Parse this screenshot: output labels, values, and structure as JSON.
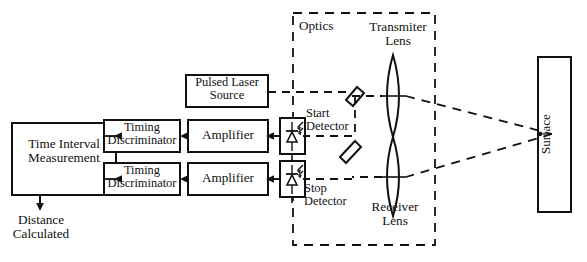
{
  "diagram": {
    "colors": {
      "stroke": "#111111",
      "background": "#ffffff",
      "beam": "#111111"
    },
    "blocks": {
      "time_interval": "Time Interval\nMeasurement",
      "timing_discriminator_top": "Timing\nDiscriminator",
      "timing_discriminator_bottom": "Timing\nDiscriminator",
      "amplifier_top": "Amplifier",
      "amplifier_bottom": "Amplifier",
      "pulsed_laser_source": "Pulsed Laser\nSource",
      "surface": "Surface",
      "distance_calculated": "Distance\nCalculated"
    },
    "optics": {
      "group_label": "Optics",
      "transmitter_lens": "Transmiter\nLens",
      "receiver_lens": "Receiver\nLens",
      "start_detector": "Start\nDetector",
      "stop_detector": "Stop\nDetector"
    },
    "icons": {
      "start_photodiode": "photodiode-icon",
      "stop_photodiode": "photodiode-icon",
      "transmitter_lens_glyph": "biconvex-lens-icon",
      "receiver_lens_glyph": "biconvex-lens-icon",
      "mirror_upper": "mirror-icon",
      "mirror_lower": "mirror-icon",
      "distance_arrow": "arrow-down-icon"
    }
  }
}
